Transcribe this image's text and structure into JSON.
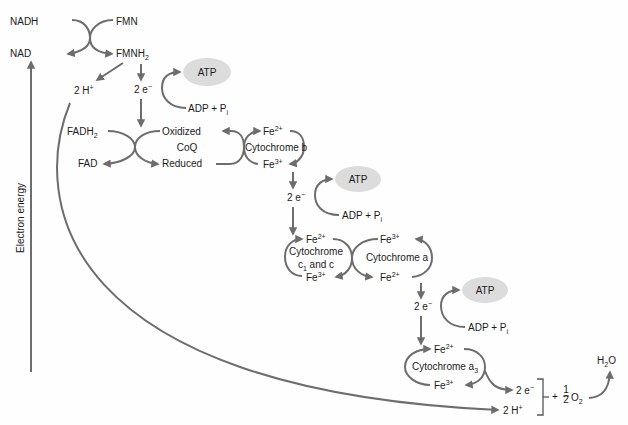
{
  "axis": {
    "label": "Electron energy"
  },
  "colors": {
    "arrow": "#6d6d6d",
    "atp_bubble": "#dcdcdc",
    "text": "#1a1a1a"
  },
  "complex1": {
    "nadh": "NADH",
    "nad": "NAD",
    "fmn": "FMN",
    "fmnh2_base": "FMNH",
    "fmnh2_sub": "2",
    "protons": "2 H",
    "protons_sup": "+",
    "electrons": "2 e",
    "electrons_sup": "−"
  },
  "atp1": {
    "atp": "ATP",
    "adp": "ADP + P",
    "adp_sub": "i"
  },
  "coq": {
    "fadh2_base": "FADH",
    "fadh2_sub": "2",
    "fad": "FAD",
    "oxidized": "Oxidized",
    "name": "CoQ",
    "reduced": "Reduced"
  },
  "cyt_b": {
    "fe2": "Fe",
    "fe2_sup": "2+",
    "name": "Cytochrome b",
    "fe3": "Fe",
    "fe3_sup": "3+"
  },
  "step2": {
    "electrons": "2 e",
    "electrons_sup": "−"
  },
  "atp2": {
    "atp": "ATP",
    "adp": "ADP + P",
    "adp_sub": "i"
  },
  "cyt_c": {
    "fe2": "Fe",
    "fe2_sup": "2+",
    "name_line1": "Cytochrome",
    "name_line2_a": "c",
    "name_line2_sub": "1",
    "name_line2_b": " and c",
    "fe3": "Fe",
    "fe3_sup": "3+"
  },
  "cyt_a": {
    "fe3": "Fe",
    "fe3_sup": "3+",
    "name": "Cytochrome a",
    "fe2": "Fe",
    "fe2_sup": "2+"
  },
  "step3": {
    "electrons": "2 e",
    "electrons_sup": "−"
  },
  "atp3": {
    "atp": "ATP",
    "adp": "ADP + P",
    "adp_sub": "i"
  },
  "cyt_a3": {
    "fe2": "Fe",
    "fe2_sup": "2+",
    "name_base": "Cytochrome a",
    "name_sub": "3",
    "fe3": "Fe",
    "fe3_sup": "3+"
  },
  "final": {
    "electrons": "2 e",
    "electrons_sup": "−",
    "protons": "2 H",
    "protons_sup": "+",
    "plus": "+",
    "frac_num": "1",
    "frac_den": "2",
    "oxygen": "O",
    "oxygen_sub": "2",
    "water_a": "H",
    "water_sub": "2",
    "water_b": "O"
  }
}
